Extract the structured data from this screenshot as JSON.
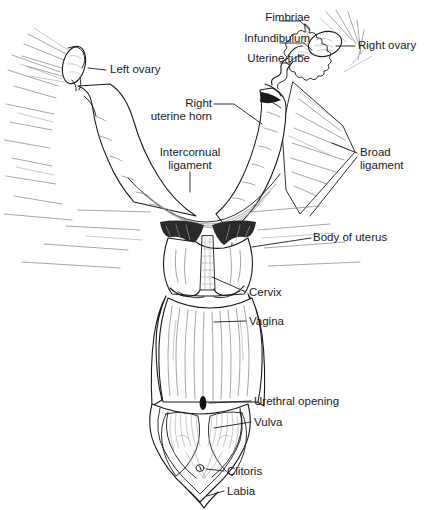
{
  "figure": {
    "style": {
      "background": "#ffffff",
      "ink": "#1a1a1a",
      "line_gray": "#7a7a7a",
      "shade_gray": "#9a9a9a",
      "dark_fill": "#111111"
    },
    "labels": [
      {
        "id": "fimbriae",
        "text": "Fimbriae",
        "align": "right",
        "x": 232,
        "y": 17,
        "w": 78
      },
      {
        "id": "infundibulum",
        "text": "Infundibulum",
        "align": "right",
        "x": 207,
        "y": 38,
        "w": 103
      },
      {
        "id": "uterine-tube",
        "text": "Uterine tube",
        "align": "right",
        "x": 210,
        "y": 58,
        "w": 100
      },
      {
        "id": "right-ovary",
        "text": "Right ovary",
        "align": "left",
        "x": 358,
        "y": 41,
        "w": 76
      },
      {
        "id": "left-ovary",
        "text": "Left ovary",
        "align": "left",
        "x": 108,
        "y": 65,
        "w": 72
      },
      {
        "id": "right-uterine-horn",
        "text": "Right\nuterine horn",
        "align": "right",
        "x": 178,
        "y": 98,
        "w": 68
      },
      {
        "id": "intercornual-ligament",
        "text": "Intercornual\nligament",
        "align": "center",
        "x": 142,
        "y": 148,
        "w": 96
      },
      {
        "id": "broad-ligament",
        "text": "Broad\nligament",
        "align": "left",
        "x": 360,
        "y": 148,
        "w": 70
      },
      {
        "id": "body-of-uterus",
        "text": "Body of uterus",
        "align": "left",
        "x": 313,
        "y": 233,
        "w": 92
      },
      {
        "id": "cervix",
        "text": "Cervix",
        "align": "left",
        "x": 248,
        "y": 288,
        "w": 45
      },
      {
        "id": "vagina",
        "text": "Vagina",
        "align": "left",
        "x": 248,
        "y": 316,
        "w": 46
      },
      {
        "id": "urethral-opening",
        "text": "Urethral opening",
        "align": "left",
        "x": 253,
        "y": 396,
        "w": 90
      },
      {
        "id": "vulva",
        "text": "Vulva",
        "align": "left",
        "x": 253,
        "y": 417,
        "w": 40
      },
      {
        "id": "clitoris",
        "text": "Clitoris",
        "align": "left",
        "x": 226,
        "y": 466,
        "w": 50
      },
      {
        "id": "labia",
        "text": "Labia",
        "align": "left",
        "x": 226,
        "y": 486,
        "w": 40
      }
    ],
    "structures": [
      "left-ovary",
      "right-ovary",
      "fimbriae",
      "infundibulum",
      "uterine-tube",
      "left-uterine-horn",
      "right-uterine-horn",
      "intercornual-ligament",
      "broad-ligament",
      "body-of-uterus",
      "cervix",
      "vagina",
      "urethral-opening",
      "vulva",
      "clitoris",
      "labia"
    ]
  }
}
